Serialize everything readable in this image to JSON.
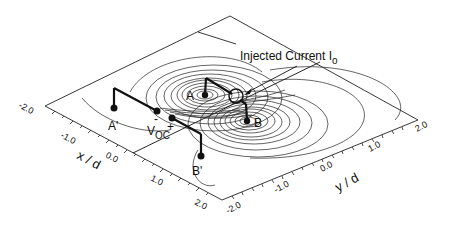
{
  "figure": {
    "annotation_current": "Injected Current I",
    "annotation_current_sub": "o",
    "electrodes": {
      "A": "A",
      "B": "B",
      "A_prime": "A'",
      "B_prime": "B'"
    },
    "voltage_label": "V",
    "voltage_sub": "OC",
    "polarity_minus": "-",
    "polarity_plus": "+"
  },
  "axes": {
    "x": {
      "title": "x / d",
      "ticks": [
        "-2.0",
        "-1.0",
        "0.0",
        "1.0",
        "2.0"
      ]
    },
    "y": {
      "title": "y / d",
      "ticks": [
        "-2.0",
        "-1.0",
        "0.0",
        "1.0",
        "2.0"
      ]
    }
  }
}
